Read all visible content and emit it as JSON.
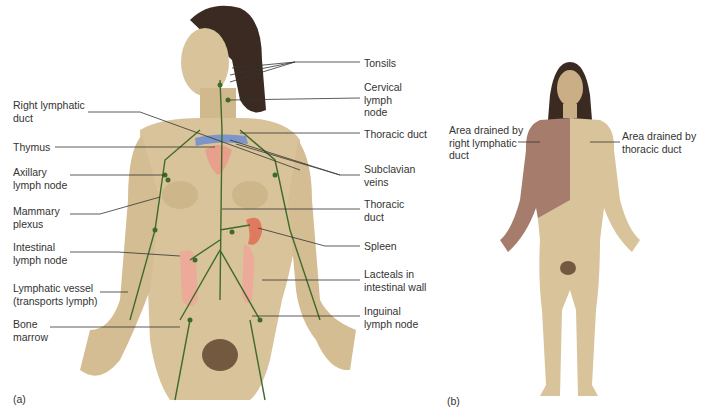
{
  "figure_a": {
    "caption": "(a)",
    "left_labels": [
      {
        "id": "right-lymphatic-duct",
        "text": "Right lymphatic\nduct"
      },
      {
        "id": "thymus",
        "text": "Thymus"
      },
      {
        "id": "axillary-lymph-node",
        "text": "Axillary\nlymph node"
      },
      {
        "id": "mammary-plexus",
        "text": "Mammary\nplexus"
      },
      {
        "id": "intestinal-lymph-node",
        "text": "Intestinal\nlymph node"
      },
      {
        "id": "lymphatic-vessel",
        "text": "Lymphatic vessel\n(transports lymph)"
      },
      {
        "id": "bone-marrow",
        "text": "Bone\nmarrow"
      }
    ],
    "right_labels": [
      {
        "id": "tonsils",
        "text": "Tonsils"
      },
      {
        "id": "cervical-lymph-node",
        "text": "Cervical\nlymph\nnode"
      },
      {
        "id": "thoracic-duct-upper",
        "text": "Thoracic duct"
      },
      {
        "id": "subclavian-veins",
        "text": "Subclavian\nveins"
      },
      {
        "id": "thoracic-duct-lower",
        "text": "Thoracic\nduct"
      },
      {
        "id": "spleen",
        "text": "Spleen"
      },
      {
        "id": "lacteals",
        "text": "Lacteals in\nintestinal wall"
      },
      {
        "id": "inguinal-lymph-node",
        "text": "Inguinal\nlymph node"
      }
    ]
  },
  "figure_b": {
    "caption": "(b)",
    "labels": [
      {
        "id": "right-lymphatic-area",
        "text": "Area drained by\nright lymphatic\nduct"
      },
      {
        "id": "thoracic-duct-area",
        "text": "Area drained by\nthoracic duct"
      }
    ]
  },
  "colors": {
    "skin": "#d9c39a",
    "skin_dark": "#b99e72",
    "hair": "#3a2a22",
    "lymph": "#3f6b2a",
    "vein": "#7d95c8",
    "organ": "#e8a08c",
    "right_area": "#a67d6c"
  }
}
